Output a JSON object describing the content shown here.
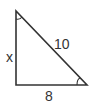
{
  "diagram": {
    "type": "right-triangle",
    "labels": {
      "vertical_leg": "x",
      "hypotenuse": "10",
      "horizontal_leg": "8"
    },
    "angle_marks": [
      "top-vertex",
      "bottom-right-vertex"
    ],
    "colors": {
      "stroke": "#333333",
      "background": "#ffffff"
    }
  }
}
